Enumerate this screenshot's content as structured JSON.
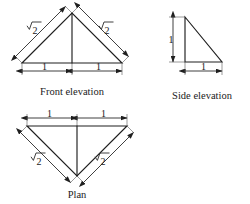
{
  "figure": {
    "background_color": "#ffffff",
    "line_color": "#1f1f1f",
    "views": [
      {
        "id": "front-elevation",
        "caption": "Front elevation",
        "shape": "isosceles-triangle-apex-up",
        "dimensions": [
          {
            "id": "front-left-slope",
            "label": "√2",
            "radicand": "2",
            "placement": "upper-left-slope"
          },
          {
            "id": "front-right-slope",
            "label": "√2",
            "radicand": "2",
            "placement": "upper-right-slope"
          },
          {
            "id": "front-base-left",
            "label": "1",
            "placement": "base-left-half"
          },
          {
            "id": "front-base-right",
            "label": "1",
            "placement": "base-right-half"
          }
        ]
      },
      {
        "id": "side-elevation",
        "caption": "Side elevation",
        "shape": "right-triangle",
        "dimensions": [
          {
            "id": "side-height",
            "label": "1",
            "placement": "left-vertical"
          },
          {
            "id": "side-base",
            "label": "1",
            "placement": "bottom-horizontal"
          }
        ]
      },
      {
        "id": "plan",
        "caption": "Plan",
        "shape": "isosceles-triangle-apex-down",
        "dimensions": [
          {
            "id": "plan-top-left",
            "label": "1",
            "placement": "top-left-half"
          },
          {
            "id": "plan-top-right",
            "label": "1",
            "placement": "top-right-half"
          },
          {
            "id": "plan-left-slope",
            "label": "√2",
            "radicand": "2",
            "placement": "lower-left-slope"
          },
          {
            "id": "plan-right-slope",
            "label": "√2",
            "radicand": "2",
            "placement": "lower-right-slope"
          }
        ]
      }
    ]
  }
}
